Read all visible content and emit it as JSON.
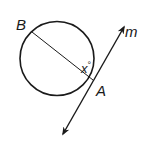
{
  "diagram": {
    "type": "geometry-circle-tangent",
    "circle": {
      "cx": 57,
      "cy": 58.5,
      "r": 37
    },
    "points": {
      "B": {
        "label": "B",
        "x": 32,
        "y": 32,
        "label_x": 16,
        "label_y": 30
      },
      "A": {
        "label": "A",
        "x": 93,
        "y": 80,
        "label_x": 96,
        "label_y": 96
      }
    },
    "segment": {
      "from": "B",
      "to": "A",
      "name": "diameter BA"
    },
    "tangent_line": {
      "label": "m",
      "x1": 63,
      "y1": 134,
      "x2": 124,
      "y2": 27,
      "label_x": 125,
      "label_y": 37
    },
    "angle": {
      "label": "x°",
      "value_text": "x",
      "degree": "°",
      "label_x": 82,
      "label_y": 72
    },
    "colors": {
      "stroke": "#1a1a1a",
      "background": "#ffffff"
    }
  }
}
